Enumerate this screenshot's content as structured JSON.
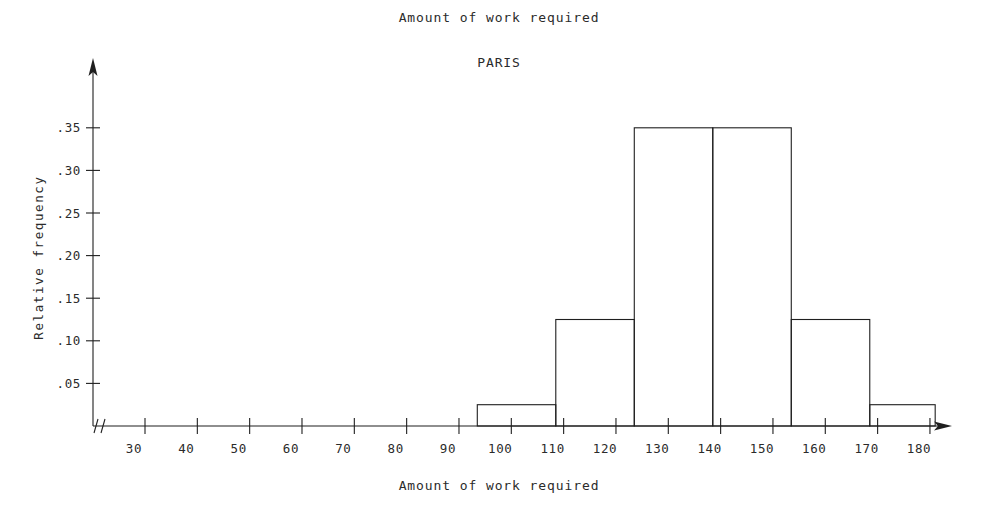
{
  "chart_data": {
    "type": "bar",
    "title": "Amount of work required",
    "subtitle": "PARIS",
    "xlabel": "Amount of work required",
    "ylabel": "Relative frequency",
    "grid": false,
    "legend": "none",
    "xlim": [
      25,
      188
    ],
    "ylim": [
      0,
      0.38
    ],
    "axis_break": "//",
    "x_tick_labels": [
      "30",
      "40",
      "50",
      "60",
      "70",
      "80",
      "90",
      "100",
      "110",
      "120",
      "130",
      "140",
      "150",
      "160",
      "170",
      "180"
    ],
    "x_tick_values": [
      30,
      40,
      50,
      60,
      70,
      80,
      90,
      100,
      110,
      120,
      130,
      140,
      150,
      160,
      170,
      180
    ],
    "y_tick_labels": [
      ".35",
      ".30",
      ".25",
      ".20",
      ".15",
      ".10",
      ".05"
    ],
    "y_tick_values": [
      0.35,
      0.3,
      0.25,
      0.2,
      0.15,
      0.1,
      0.05
    ],
    "bins": [
      {
        "start": 93.5,
        "end": 108.5,
        "value": 0.025
      },
      {
        "start": 108.5,
        "end": 123.5,
        "value": 0.125
      },
      {
        "start": 123.5,
        "end": 138.5,
        "value": 0.35
      },
      {
        "start": 138.5,
        "end": 153.5,
        "value": 0.35
      },
      {
        "start": 153.5,
        "end": 168.5,
        "value": 0.125
      },
      {
        "start": 168.5,
        "end": 181.0,
        "value": 0.025
      }
    ],
    "categories": [
      "93.5-108.5",
      "108.5-123.5",
      "123.5-138.5",
      "138.5-153.5",
      "153.5-168.5",
      "168.5-181.0"
    ],
    "values": [
      0.025,
      0.125,
      0.35,
      0.35,
      0.125,
      0.025
    ],
    "colors": {
      "line": "#1f1f1f",
      "fill": "#ffffff",
      "text": "#2b2b2b",
      "background": "#ffffff"
    }
  }
}
